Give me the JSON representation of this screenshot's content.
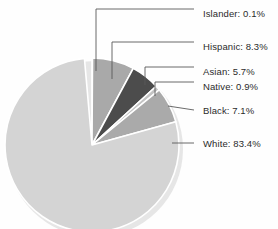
{
  "chart_data": {
    "type": "pie",
    "title": "",
    "subtitle": "",
    "xlabel": "",
    "ylabel": "",
    "legend_position": "callout-labels-right",
    "grid": false,
    "total_percent": 105.5,
    "units": "percent",
    "categories": [
      "Islander",
      "Hispanic",
      "Asian",
      "Native",
      "Black",
      "White"
    ],
    "values": [
      0.1,
      8.3,
      5.7,
      0.9,
      7.1,
      83.4
    ],
    "slices": [
      {
        "name": "Islander",
        "value": 0.1,
        "label": "Islander: 0.1%",
        "color": "#b8b8b8",
        "start_angle": 0.0,
        "end_angle": 0.34,
        "label_x": 203,
        "label_y": 9,
        "leader_elbow_x": 96,
        "leader_elbow_y": 9,
        "leader_anchor_x": 96,
        "leader_anchor_y": 71
      },
      {
        "name": "Hispanic",
        "value": 8.3,
        "label": "Hispanic: 8.3%",
        "color": "#a9a9a9",
        "start_angle": 0.34,
        "end_angle": 28.3,
        "label_x": 203,
        "label_y": 42,
        "leader_elbow_x": 112,
        "leader_elbow_y": 42,
        "leader_anchor_x": 112,
        "leader_anchor_y": 79
      },
      {
        "name": "Asian",
        "value": 5.7,
        "label": "Asian: 5.7%",
        "color": "#4c4c4c",
        "start_angle": 28.3,
        "end_angle": 47.5,
        "label_x": 203,
        "label_y": 67,
        "leader_elbow_x": 145,
        "leader_elbow_y": 67,
        "leader_anchor_x": 145,
        "leader_anchor_y": 85
      },
      {
        "name": "Native",
        "value": 0.9,
        "label": "Native: 0.9%",
        "color": "#c4c4c4",
        "start_angle": 47.5,
        "end_angle": 50.6,
        "label_x": 203,
        "label_y": 82,
        "leader_elbow_x": 155,
        "leader_elbow_y": 82,
        "leader_anchor_x": 155,
        "leader_anchor_y": 96
      },
      {
        "name": "Black",
        "value": 7.1,
        "label": "Black: 7.1%",
        "color": "#aaaaaa",
        "start_angle": 50.6,
        "end_angle": 74.5,
        "label_x": 203,
        "label_y": 106,
        "leader_elbow_x": 168,
        "leader_elbow_y": 106,
        "leader_anchor_x": 168,
        "leader_anchor_y": 106
      },
      {
        "name": "White",
        "value": 83.4,
        "label": "White: 83.4%",
        "color": "#d4d4d4",
        "start_angle": 74.5,
        "end_angle": 355.0,
        "label_x": 203,
        "label_y": 139,
        "leader_elbow_x": 172,
        "leader_elbow_y": 143,
        "leader_anchor_x": 172,
        "leader_anchor_y": 143
      }
    ],
    "geometry": {
      "center_x": 92,
      "center_y": 145,
      "radius": 87,
      "separator_color": "#ffffff",
      "separator_width": 1.6,
      "shadow_color": "#e6e6e6"
    },
    "style": {
      "background": "#fefefe",
      "leader_color": "#5a5a5a",
      "text_color": "#2b2b2b"
    }
  }
}
